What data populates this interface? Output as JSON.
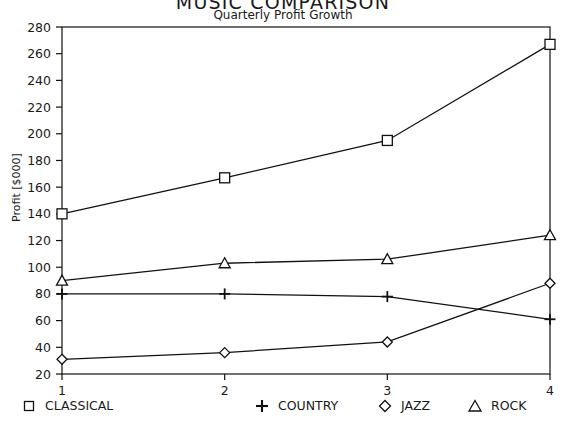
{
  "chart_data": {
    "type": "line",
    "title": "MUSIC COMPARISON",
    "subtitle": "Quarterly Profit Growth",
    "xlabel": "",
    "ylabel": "Profit [$000]",
    "x": [
      1,
      2,
      3,
      4
    ],
    "categories": [
      "1",
      "2",
      "3",
      "4"
    ],
    "xlim": [
      1,
      4
    ],
    "ylim": [
      20,
      280
    ],
    "yticks": [
      20,
      40,
      60,
      80,
      100,
      120,
      140,
      160,
      180,
      200,
      220,
      240,
      260,
      280
    ],
    "xticks": [
      1,
      2,
      3,
      4
    ],
    "grid": false,
    "legend_position": "bottom",
    "series": [
      {
        "name": "CLASSICAL",
        "marker": "square",
        "values": [
          140,
          167,
          195,
          267
        ]
      },
      {
        "name": "COUNTRY",
        "marker": "plus",
        "values": [
          80,
          80,
          78,
          61
        ]
      },
      {
        "name": "JAZZ",
        "marker": "diamond",
        "values": [
          31,
          36,
          44,
          88
        ]
      },
      {
        "name": "ROCK",
        "marker": "triangle",
        "values": [
          90,
          103,
          106,
          124
        ]
      }
    ]
  },
  "axis": {
    "ytick_labels": [
      "280",
      "260",
      "240",
      "220",
      "200",
      "180",
      "160",
      "140",
      "120",
      "100",
      "80",
      "60",
      "40",
      "20"
    ],
    "xtick_labels": [
      "1",
      "2",
      "3",
      "4"
    ]
  },
  "legend": {
    "items": [
      {
        "label": "CLASSICAL",
        "marker": "square"
      },
      {
        "label": "COUNTRY",
        "marker": "plus"
      },
      {
        "label": "JAZZ",
        "marker": "diamond"
      },
      {
        "label": "ROCK",
        "marker": "triangle"
      }
    ]
  },
  "colors": {
    "line": "#111111",
    "axis": "#111111",
    "background": "#ffffff",
    "text": "#1a1a1a"
  }
}
